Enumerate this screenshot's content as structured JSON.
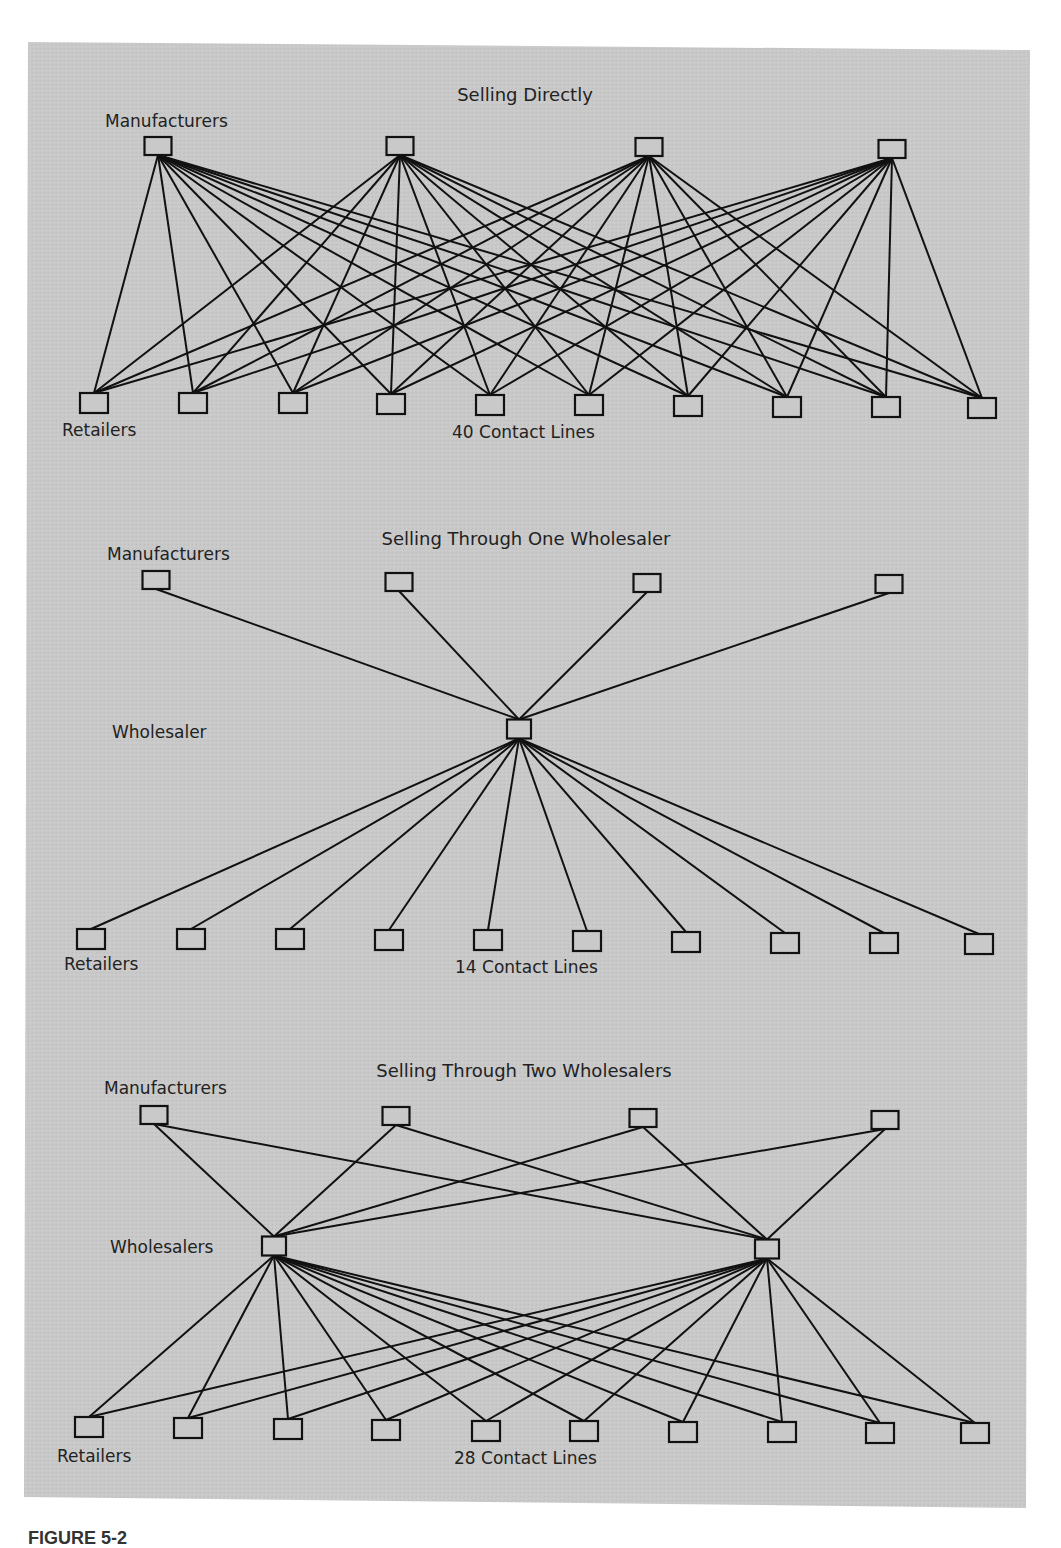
{
  "figure": {
    "background": "#c8c8c8",
    "line_color": "#111111",
    "caption_fragment": "FIGURE 5-2"
  },
  "diagrams": [
    {
      "id": "direct",
      "title": "Selling Directly",
      "manufacturers_label": "Manufacturers",
      "retailers_label": "Retailers",
      "contact_label": "40 Contact Lines",
      "contact_count": 40,
      "manufacturers": [
        [
          158,
          146
        ],
        [
          400,
          146
        ],
        [
          649,
          147
        ],
        [
          892,
          149
        ]
      ],
      "retailers": [
        [
          94,
          403
        ],
        [
          193,
          403
        ],
        [
          293,
          403
        ],
        [
          391,
          404
        ],
        [
          490,
          405
        ],
        [
          589,
          405
        ],
        [
          688,
          406
        ],
        [
          787,
          407
        ],
        [
          886,
          407
        ],
        [
          982,
          408
        ]
      ],
      "wholesalers": []
    },
    {
      "id": "one-wholesaler",
      "title": "Selling Through One Wholesaler",
      "manufacturers_label": "Manufacturers",
      "wholesaler_label": "Wholesaler",
      "retailers_label": "Retailers",
      "contact_label": "14 Contact Lines",
      "contact_count": 14,
      "manufacturers": [
        [
          156,
          580
        ],
        [
          399,
          582
        ],
        [
          647,
          583
        ],
        [
          889,
          584
        ]
      ],
      "wholesalers": [
        [
          519,
          729
        ]
      ],
      "retailers": [
        [
          91,
          939
        ],
        [
          191,
          939
        ],
        [
          290,
          939
        ],
        [
          389,
          940
        ],
        [
          488,
          940
        ],
        [
          587,
          941
        ],
        [
          686,
          942
        ],
        [
          785,
          943
        ],
        [
          884,
          943
        ],
        [
          979,
          944
        ]
      ]
    },
    {
      "id": "two-wholesalers",
      "title": "Selling Through Two Wholesalers",
      "manufacturers_label": "Manufacturers",
      "wholesaler_label": "Wholesalers",
      "retailers_label": "Retailers",
      "contact_label": "28 Contact Lines",
      "contact_count": 28,
      "manufacturers": [
        [
          154,
          1115
        ],
        [
          396,
          1116
        ],
        [
          643,
          1118
        ],
        [
          885,
          1120
        ]
      ],
      "wholesalers": [
        [
          274,
          1246
        ],
        [
          767,
          1249
        ]
      ],
      "retailers": [
        [
          89,
          1427
        ],
        [
          188,
          1428
        ],
        [
          288,
          1429
        ],
        [
          386,
          1430
        ],
        [
          486,
          1431
        ],
        [
          584,
          1431
        ],
        [
          683,
          1432
        ],
        [
          782,
          1432
        ],
        [
          880,
          1433
        ],
        [
          975,
          1433
        ]
      ]
    }
  ],
  "chart_data": {
    "type": "diagram",
    "panels": [
      {
        "title": "Selling Directly",
        "manufacturers": 4,
        "wholesalers": 0,
        "retailers": 10,
        "contact_lines": 40
      },
      {
        "title": "Selling Through One Wholesaler",
        "manufacturers": 4,
        "wholesalers": 1,
        "retailers": 10,
        "contact_lines": 14
      },
      {
        "title": "Selling Through Two Wholesalers",
        "manufacturers": 4,
        "wholesalers": 2,
        "retailers": 10,
        "contact_lines": 28
      }
    ]
  }
}
